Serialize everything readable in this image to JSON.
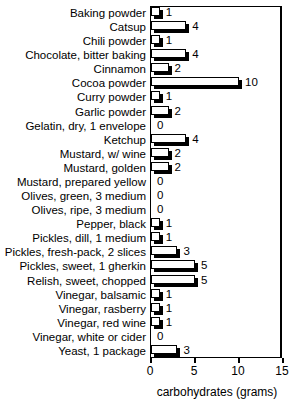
{
  "chart_data": {
    "type": "bar",
    "orientation": "horizontal",
    "title": "MISCELLANEOUS FOODS",
    "xlabel": "carbohydrates (grams)",
    "ylabel": "",
    "xlim": [
      0,
      15
    ],
    "xticks": [
      0,
      5,
      10,
      15
    ],
    "xtick_labels": [
      "0",
      "5",
      "10",
      "15"
    ],
    "grid": false,
    "legend": null,
    "categories": [
      "Baking powder",
      "Catsup",
      "Chili powder",
      "Chocolate, bitter baking",
      "Cinnamon",
      "Cocoa powder",
      "Curry powder",
      "Garlic powder",
      "Gelatin, dry, 1 envelope",
      "Ketchup",
      "Mustard, w/ wine",
      "Mustard, golden",
      "Mustard, prepared yellow",
      "Olives, green, 3 medium",
      "Olives, ripe, 3 medium",
      "Pepper, black",
      "Pickles, dill, 1 medium",
      "Pickles, fresh-pack, 2 slices",
      "Pickles, sweet, 1 gherkin",
      "Relish, sweet, chopped",
      "Vinegar, balsamic",
      "Vinegar, rasberry",
      "Vinegar, red wine",
      "Vinegar, white or cider",
      "Yeast, 1 package"
    ],
    "values": [
      1,
      4,
      1,
      4,
      2,
      10,
      1,
      2,
      0,
      4,
      2,
      2,
      0,
      0,
      0,
      1,
      1,
      3,
      5,
      5,
      1,
      1,
      1,
      0,
      3
    ],
    "value_labels": [
      "1",
      "4",
      "1",
      "4",
      "2",
      "10",
      "1",
      "2",
      "0",
      "4",
      "2",
      "2",
      "0",
      "0",
      "0",
      "1",
      "1",
      "3",
      "5",
      "5",
      "1",
      "1",
      "1",
      "0",
      "3"
    ]
  },
  "colors": {
    "bar_face": "#ffffff",
    "bar_edge": "#000000",
    "bar_shadow": "#000000",
    "axis": "#000000",
    "background": "#ffffff",
    "text": "#000000"
  }
}
